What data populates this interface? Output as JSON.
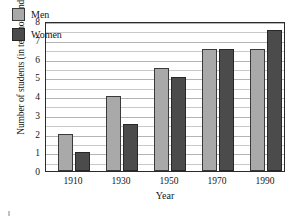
{
  "chart_data": {
    "type": "bar",
    "title": "",
    "xlabel": "Year",
    "ylabel": "Number of students (in ten thousands)",
    "categories": [
      "1910",
      "1930",
      "1950",
      "1970",
      "1990"
    ],
    "series": [
      {
        "name": "Men",
        "color": "#a9a9a9",
        "values": [
          2.0,
          4.0,
          5.5,
          6.5,
          6.5
        ]
      },
      {
        "name": "Women",
        "color": "#4b4b4b",
        "values": [
          1.0,
          2.5,
          5.0,
          6.5,
          7.5
        ]
      }
    ],
    "ylim": [
      0,
      8
    ],
    "ytick_labels": [
      "0",
      "1",
      "2",
      "3",
      "4",
      "5",
      "6",
      "7",
      "8"
    ],
    "ytick_values": [
      0,
      1,
      2,
      3,
      4,
      5,
      6,
      7,
      8
    ],
    "grid": true,
    "grid_step": 0.5,
    "legend_position": "top-left"
  }
}
